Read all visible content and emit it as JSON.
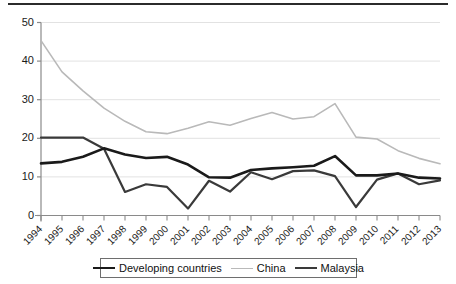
{
  "chart_data": {
    "type": "line",
    "title": "",
    "subtitle": "",
    "xlabel": "",
    "ylabel": "",
    "xlim": [
      1994,
      2013
    ],
    "ylim": [
      0,
      50
    ],
    "yticks": [
      0,
      10,
      20,
      30,
      40,
      50
    ],
    "grid": "horizontal",
    "legend_position": "bottom",
    "categories": [
      "1994",
      "1995",
      "1996",
      "1997",
      "1998",
      "1999",
      "2000",
      "2001",
      "2002",
      "2003",
      "2004",
      "2005",
      "2006",
      "2007",
      "2008",
      "2009",
      "2010",
      "2011",
      "2012",
      "2013"
    ],
    "series": [
      {
        "name": "Developing countries",
        "color": "#1a1a1a",
        "width": 2.6,
        "values": [
          13.5,
          13.9,
          15.2,
          17.4,
          15.8,
          14.9,
          15.2,
          13.2,
          9.9,
          9.8,
          11.8,
          12.2,
          12.5,
          12.9,
          15.4,
          10.4,
          10.4,
          10.9,
          9.8,
          9.6
        ]
      },
      {
        "name": "China",
        "color": "#b9b9b9",
        "width": 1.6,
        "values": [
          45.3,
          37.2,
          32.3,
          27.8,
          24.4,
          21.7,
          21.2,
          22.6,
          24.3,
          23.4,
          25.1,
          26.7,
          25.0,
          25.6,
          29.0,
          20.3,
          19.8,
          16.8,
          14.8,
          13.4
        ]
      },
      {
        "name": "Malaysia",
        "color": "#3a3a3a",
        "width": 2.2,
        "values": [
          20.2,
          20.2,
          20.2,
          17.3,
          6.1,
          8.1,
          7.4,
          1.8,
          9.0,
          6.2,
          11.2,
          9.4,
          11.5,
          11.7,
          10.2,
          2.2,
          9.3,
          10.9,
          8.1,
          9.1
        ]
      }
    ]
  },
  "axes": {
    "ytick_labels": [
      "50",
      "40",
      "30",
      "20",
      "10",
      "0"
    ],
    "xtick_labels": [
      "1994",
      "1995",
      "1996",
      "1997",
      "1998",
      "1999",
      "2000",
      "2001",
      "2002",
      "2003",
      "2004",
      "2005",
      "2006",
      "2007",
      "2008",
      "2009",
      "2010",
      "2011",
      "2012",
      "2013"
    ]
  },
  "legend": {
    "entries": [
      {
        "label": "Developing countries",
        "swatch": "line-swatch-developing"
      },
      {
        "label": "China",
        "swatch": "line-swatch-china"
      },
      {
        "label": "Malaysia",
        "swatch": "line-swatch-malaysia"
      }
    ]
  }
}
